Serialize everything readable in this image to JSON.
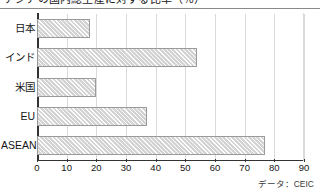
{
  "chart_data": {
    "type": "bar",
    "orientation": "horizontal",
    "title": "アジアの国内総生産に対する比率（％）",
    "xlabel": "",
    "ylabel": "",
    "categories": [
      "日本",
      "インド",
      "米国",
      "EU",
      "ASEAN"
    ],
    "values": [
      18,
      54,
      20,
      37,
      77
    ],
    "xlim": [
      0,
      90
    ],
    "xticks": [
      0,
      10,
      20,
      30,
      40,
      50,
      60,
      70,
      80,
      90
    ],
    "xtick_labels": [
      "0",
      "10",
      "20",
      "30",
      "40",
      "50",
      "60",
      "70",
      "80",
      "90"
    ],
    "grid": true,
    "grid_axis": "x",
    "legend": false,
    "bar_fill": "#d3d3d3",
    "bar_hatch": "diagonal",
    "bar_edge_color": "#9a9a9a",
    "axis_color": "#333333",
    "gridline_color": "#d9d9d9",
    "source_note": "データ：CEIC"
  }
}
